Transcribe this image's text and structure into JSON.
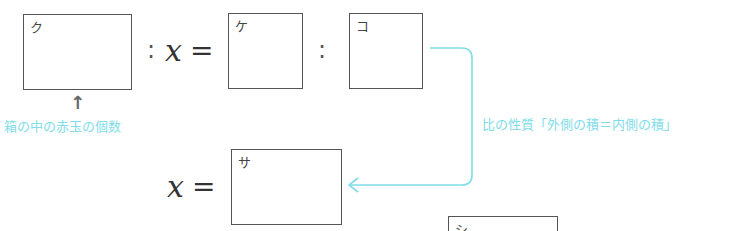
{
  "equation1": {
    "box_left_label": "ク",
    "colon1": ":",
    "variable": "x",
    "equals": "=",
    "box_mid_label": "ケ",
    "colon2": ":",
    "box_right_label": "コ"
  },
  "annotation_left": {
    "arrow": "↑",
    "text": "箱の中の赤玉の個数"
  },
  "annotation_right": {
    "text": "比の性質「外側の積＝内側の積」"
  },
  "equation2": {
    "variable": "x",
    "equals": "=",
    "box_label": "サ"
  },
  "bottom_box": {
    "label": "シ"
  },
  "colors": {
    "accent_cyan": "#7fdde8",
    "box_border": "#555555"
  }
}
